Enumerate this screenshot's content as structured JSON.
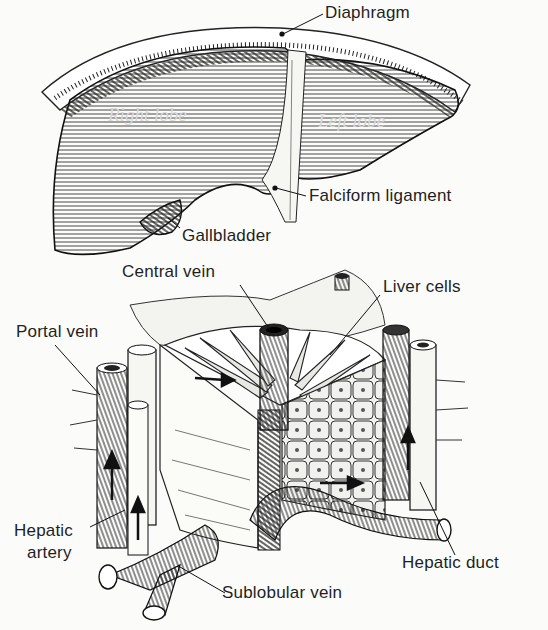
{
  "figure": {
    "top": {
      "name": "liver-external-view",
      "lobes": {
        "right": "Right lobe",
        "left": "Left lobe"
      },
      "labels": {
        "diaphragm": "Diaphragm",
        "falciform": "Falciform ligament",
        "gallbladder": "Gallbladder"
      }
    },
    "bottom": {
      "name": "liver-lobule-cutaway",
      "labels": {
        "central_vein": "Central vein",
        "liver_cells": "Liver cells",
        "portal_vein": "Portal vein",
        "hepatic_artery_line1": "Hepatic",
        "hepatic_artery_line2": "artery",
        "hepatic_duct": "Hepatic duct",
        "sublobular_vein": "Sublobular vein"
      }
    },
    "colors": {
      "ink": "#1c1c1c",
      "paper": "#fbfbfa",
      "shade": "#8a8a8a"
    }
  }
}
